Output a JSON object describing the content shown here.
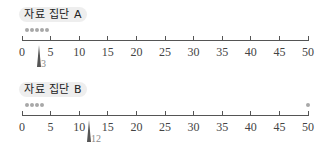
{
  "chart_data": [
    {
      "type": "scatter",
      "title": "자료 집단 A",
      "points": [
        1,
        2,
        3,
        4,
        5
      ],
      "mean": 3,
      "mean_label": "3",
      "xlim": [
        0,
        50
      ],
      "ticks": [
        0,
        5,
        10,
        15,
        20,
        25,
        30,
        35,
        40,
        45,
        50
      ],
      "xlabel": "",
      "ylabel": "",
      "grid": false
    },
    {
      "type": "scatter",
      "title": "자료 집단 B",
      "points": [
        1,
        2,
        3,
        4,
        50
      ],
      "mean": 12,
      "mean_label": "12",
      "xlim": [
        0,
        50
      ],
      "ticks": [
        0,
        5,
        10,
        15,
        20,
        25,
        30,
        35,
        40,
        45,
        50
      ],
      "xlabel": "",
      "ylabel": "",
      "grid": false
    }
  ],
  "panels": [
    {
      "title": "자료 집단 A",
      "mean_label": "3"
    },
    {
      "title": "자료 집단 B",
      "mean_label": "12"
    }
  ],
  "tick_labels": [
    "0",
    "5",
    "10",
    "15",
    "20",
    "25",
    "30",
    "35",
    "40",
    "45",
    "50"
  ],
  "colors": {
    "dot": "#a8a8a8",
    "axis": "#555555",
    "title_bg": "#eeeeee",
    "mean_marker": "#555555"
  }
}
